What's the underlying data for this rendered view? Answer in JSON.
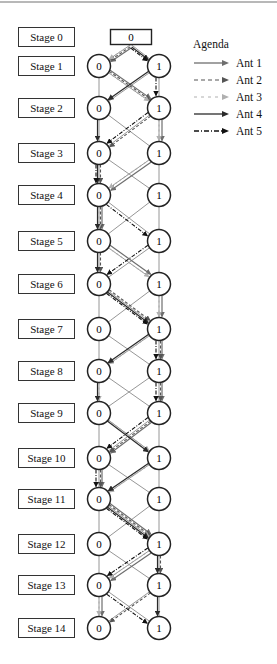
{
  "figure": {
    "colors": {
      "node_stroke": "#222222",
      "grid_edge": "#8a8a8a",
      "ant1": "#6e6e6e",
      "ant2": "#555555",
      "ant3": "#b0b0b0",
      "ant4": "#2a2a2a",
      "ant5": "#111111"
    },
    "start_node": {
      "label": "0",
      "x": 131,
      "y": 37,
      "w": 41,
      "h": 15
    },
    "node_x": {
      "0": 99,
      "1": 159
    },
    "node_radius": 11.5,
    "stages": [
      {
        "label": "Stage 0",
        "y": 37
      },
      {
        "label": "Stage 1",
        "y": 66,
        "nodes": [
          "0",
          "1"
        ]
      },
      {
        "label": "Stage 2",
        "y": 108,
        "nodes": [
          "0",
          "1"
        ]
      },
      {
        "label": "Stage 3",
        "y": 153,
        "nodes": [
          "0",
          "1"
        ]
      },
      {
        "label": "Stage 4",
        "y": 195,
        "nodes": [
          "0",
          "1"
        ]
      },
      {
        "label": "Stage 5",
        "y": 241,
        "nodes": [
          "0",
          "1"
        ]
      },
      {
        "label": "Stage 6",
        "y": 284,
        "nodes": [
          "0",
          "1"
        ]
      },
      {
        "label": "Stage 7",
        "y": 329,
        "nodes": [
          "0",
          "1"
        ]
      },
      {
        "label": "Stage 8",
        "y": 371,
        "nodes": [
          "0",
          "1"
        ]
      },
      {
        "label": "Stage 9",
        "y": 413,
        "nodes": [
          "0",
          "1"
        ]
      },
      {
        "label": "Stage 10",
        "y": 458,
        "nodes": [
          "0",
          "1"
        ]
      },
      {
        "label": "Stage 11",
        "y": 499,
        "nodes": [
          "0",
          "1"
        ]
      },
      {
        "label": "Stage 12",
        "y": 544,
        "nodes": [
          "0",
          "1"
        ]
      },
      {
        "label": "Stage 13",
        "y": 585,
        "nodes": [
          "0",
          "1"
        ]
      },
      {
        "label": "Stage 14",
        "y": 628,
        "nodes": [
          "0",
          "1"
        ]
      }
    ],
    "ant_paths": {
      "Ant 1": [
        "S",
        "0",
        "1",
        "1",
        "0",
        "0",
        "1",
        "1",
        "1",
        "1",
        "0",
        "0",
        "1",
        "0",
        "0"
      ],
      "Ant 2": [
        "S",
        "0",
        "1",
        "0",
        "0",
        "0",
        "0",
        "1",
        "1",
        "1",
        "0",
        "0",
        "1",
        "1",
        "0"
      ],
      "Ant 3": [
        "S",
        "0",
        "1",
        "1",
        "0",
        "0",
        "1",
        "1",
        "0",
        "0",
        "1",
        "0",
        "1",
        "0",
        "0"
      ],
      "Ant 4": [
        "S",
        "1",
        "0",
        "0",
        "0",
        "0",
        "0",
        "1",
        "0",
        "0",
        "1",
        "0",
        "1",
        "1",
        "1"
      ],
      "Ant 5": [
        "S",
        "1",
        "1",
        "0",
        "0",
        "1",
        "0",
        "1",
        "1",
        "1",
        "0",
        "0",
        "1",
        "0",
        "1"
      ]
    }
  },
  "legend": {
    "title": "Agenda",
    "items": [
      {
        "label": "Ant 1",
        "style": "solid",
        "color": "#6e6e6e"
      },
      {
        "label": "Ant 2",
        "style": "dashed",
        "color": "#555555"
      },
      {
        "label": "Ant 3",
        "style": "dashed-light",
        "color": "#b0b0b0"
      },
      {
        "label": "Ant 4",
        "style": "solid-dark",
        "color": "#2a2a2a"
      },
      {
        "label": "Ant 5",
        "style": "dash-dot",
        "color": "#111111"
      }
    ]
  },
  "caption": ""
}
